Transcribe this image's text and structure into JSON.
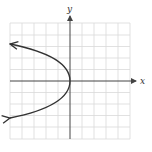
{
  "figure": {
    "type": "coordinate-plane-graph",
    "x_axis_label": "x",
    "y_axis_label": "y",
    "grid": {
      "xmin": -5,
      "xmax": 5,
      "ymin": -5,
      "ymax": 5,
      "step": 1
    },
    "curve": {
      "equation": "x = -y^2/2",
      "vertex": [
        0,
        0
      ],
      "direction": "opens left",
      "points": [
        [
          -5,
          3.16
        ],
        [
          -4.5,
          3
        ],
        [
          -2,
          2
        ],
        [
          -0.5,
          1
        ],
        [
          0,
          0
        ],
        [
          -0.5,
          -1
        ],
        [
          -2,
          -2
        ],
        [
          -4.5,
          -3
        ],
        [
          -5,
          -3.16
        ]
      ],
      "arrows_at_ends": true
    },
    "colors": {
      "grid": "#d9d9d9",
      "axis": "#444444",
      "curve": "#333333"
    }
  }
}
